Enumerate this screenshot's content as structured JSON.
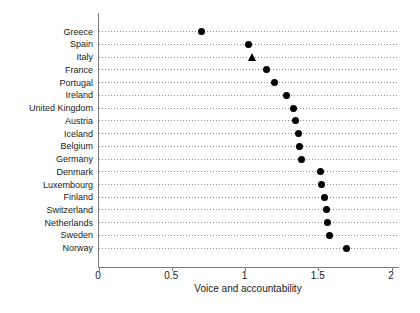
{
  "figure": {
    "colors": {
      "background": "#ffffff",
      "text": "#1a1a1a",
      "axis": "#7a7a7a",
      "gridline": "#8c8c8c",
      "marker": "#000000"
    }
  },
  "chart_data": {
    "type": "scatter",
    "subtype": "horizontal-dot-plot",
    "title": "",
    "xlabel": "Voice and accountability",
    "ylabel": "",
    "xlim": [
      0,
      2
    ],
    "xticks": [
      0,
      0.5,
      1,
      1.5,
      2
    ],
    "xtick_labels": [
      "0",
      "0.5",
      "1",
      "1.5",
      "2"
    ],
    "grid": "dotted horizontal guide per category",
    "legend": "none",
    "highlighted_category": "Italy",
    "categories": [
      "Greece",
      "Spain",
      "Italy",
      "France",
      "Portugal",
      "Ireland",
      "United Kingdom",
      "Austria",
      "Iceland",
      "Belgium",
      "Germany",
      "Denmark",
      "Luxembourg",
      "Finland",
      "Switzerland",
      "Netherlands",
      "Sweden",
      "Norway"
    ],
    "values": [
      0.7,
      1.02,
      1.05,
      1.14,
      1.2,
      1.28,
      1.33,
      1.34,
      1.36,
      1.37,
      1.38,
      1.51,
      1.52,
      1.54,
      1.55,
      1.56,
      1.57,
      1.69
    ],
    "markers": [
      "circle",
      "circle",
      "triangle",
      "circle",
      "circle",
      "circle",
      "circle",
      "circle",
      "circle",
      "circle",
      "circle",
      "circle",
      "circle",
      "circle",
      "circle",
      "circle",
      "circle",
      "circle"
    ]
  }
}
